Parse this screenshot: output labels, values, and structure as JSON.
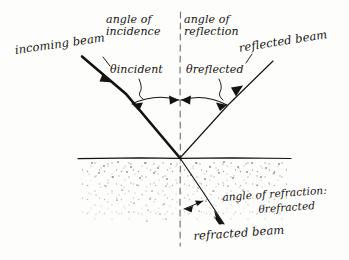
{
  "diagram": {
    "colors": {
      "ink": "#15130f",
      "paper": "#fdfdfc",
      "normal_line": "#6b6b6b",
      "stipple": "#2b2723"
    },
    "labels": {
      "angle_of_incidence_line1": "angle of",
      "angle_of_incidence_line2": "incidence",
      "angle_of_reflection_line1": "angle of",
      "angle_of_reflection_line2": "reflection",
      "incoming_beam": "incoming beam",
      "reflected_beam": "reflected beam",
      "theta_incident": "θincident",
      "theta_reflected": "θreflected",
      "angle_of_refraction": "angle of refraction:",
      "theta_refracted": "θrefracted",
      "refracted_beam": "refracted beam"
    },
    "elements": {
      "interface_line": "horizontal-surface",
      "normal_line": "dashed-vertical-normal",
      "incident_ray": "incoming-beam-ray",
      "reflected_ray": "reflected-beam-ray",
      "refracted_ray": "refracted-beam-ray",
      "incidence_arc": "angle-of-incidence-arc",
      "reflection_arc": "angle-of-reflection-arc",
      "refraction_arc": "angle-of-refraction-arc",
      "medium_fill": "stippled-denser-medium"
    },
    "geometry": {
      "intersection_x": 180,
      "intersection_y": 158,
      "surface_y": 158,
      "surface_x_start": 78,
      "surface_x_end": 291,
      "normal_top_y": 12,
      "normal_bottom_y": 246
    }
  }
}
